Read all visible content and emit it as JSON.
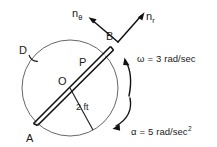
{
  "figure": {
    "background_color": "#ffffff",
    "ink_color": "#111111",
    "outline_color": "#555555"
  },
  "labels": {
    "point_a": "A",
    "point_b": "B",
    "point_o": "O",
    "point_p": "P",
    "disk_d": "D",
    "radius_dimension": "2 ft"
  },
  "vectors": {
    "n_theta": {
      "symbol": "n",
      "subscript": "θ"
    },
    "n_r": {
      "symbol": "n",
      "subscript": "r"
    }
  },
  "annotations": {
    "omega": {
      "symbol": "ω",
      "equals": "=",
      "value": "3",
      "unit": "rad/sec",
      "text": "ω = 3 rad/sec"
    },
    "alpha": {
      "symbol": "α",
      "equals": "=",
      "value": "5",
      "unit": "rad/sec",
      "exponent": "2",
      "text": "α = 5 rad/sec"
    }
  }
}
